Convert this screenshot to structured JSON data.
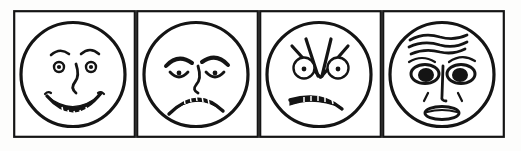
{
  "figure": {
    "kind": "emotional-faces-strip",
    "panel_count": 4,
    "border_color": "#141414",
    "ink_color": "#141414",
    "background_color": "#ffffff",
    "page_background": "#fdfdfc",
    "style": "hand-drawn line art"
  },
  "panels": [
    {
      "index": "1",
      "emotion": "happy",
      "caption": "",
      "features": {
        "eyes": "small round eyes with dot pupils and ring irises",
        "brows": "short arched curves raised above each eye",
        "nose": "single curved squiggle line down the center",
        "mouth": "wide upturned smile with small teeth along the upper edge",
        "cheeks": "short comma-shaped crease marks at each side of the mouth"
      }
    },
    {
      "index": "2",
      "emotion": "sad",
      "caption": "",
      "features": {
        "eyes": "small dot pupils set under heavy drooping lids",
        "brows": "thick brows slanting down and outward toward the temples",
        "nose": "narrow curved line down the center",
        "mouth": "wide downturned frown with teeth showing along the upper edge",
        "cheeks": "none"
      }
    },
    {
      "index": "3",
      "emotion": "angry",
      "caption": "",
      "features": {
        "eyes": "round eyes with dot pupils, ringed, glaring",
        "brows": "sharp straight lines radiating in a V from between the eyes",
        "nose": "not drawn",
        "mouth": "flat grimace slanting downward with a band of teeth",
        "cheeks": "none"
      }
    },
    {
      "index": "4",
      "emotion": "fearful",
      "caption": "",
      "features": {
        "eyes": "wide open almond eyes with large solid black pupils",
        "brows": "thin brows raised and curved upward at the inner ends",
        "nose": "long vertical line with a small tip curve",
        "mouth": "small open oval mouth, lips parted",
        "cheeks": "short diagonal crease lines beside the nose",
        "forehead": "three stacked wavy worry wrinkles"
      }
    }
  ]
}
